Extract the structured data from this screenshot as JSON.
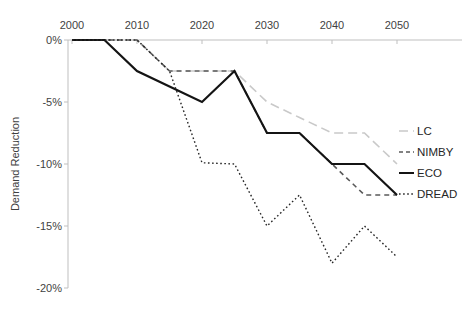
{
  "chart_data": {
    "type": "line",
    "title": "",
    "xlabel": "",
    "ylabel": "Demand Reduction",
    "xlim": [
      2000,
      2050
    ],
    "ylim": [
      -20,
      0
    ],
    "grid": false,
    "legend_position": "right",
    "axis_color": "#bfbfbf",
    "label_color": "#3f3f3f",
    "xticks": [
      2000,
      2010,
      2020,
      2030,
      2040,
      2050
    ],
    "yticks": [
      {
        "value": 0,
        "label": "0%"
      },
      {
        "value": -5,
        "label": "-5%"
      },
      {
        "value": -10,
        "label": "-10%"
      },
      {
        "value": -15,
        "label": "-15%"
      },
      {
        "value": -20,
        "label": "-20%"
      }
    ],
    "x": [
      2000,
      2005,
      2010,
      2015,
      2020,
      2025,
      2030,
      2035,
      2040,
      2045,
      2050
    ],
    "series": [
      {
        "name": "LC",
        "style": "long-dash",
        "color": "#c9c9c9",
        "width": 1.6,
        "values": [
          0,
          0,
          0,
          -2.5,
          -2.5,
          -2.5,
          -5,
          -6.25,
          -7.5,
          -7.5,
          -10
        ]
      },
      {
        "name": "NIMBY",
        "style": "dashed",
        "color": "#595959",
        "width": 1.6,
        "values": [
          0,
          0,
          0,
          -2.5,
          -2.5,
          -2.5,
          -7.5,
          -7.5,
          -10,
          -12.5,
          -12.5
        ]
      },
      {
        "name": "ECO",
        "style": "solid",
        "color": "#141414",
        "width": 2.2,
        "values": [
          0,
          0,
          -2.5,
          -3.75,
          -5,
          -2.5,
          -7.5,
          -7.5,
          -10,
          -10,
          -12.5
        ]
      },
      {
        "name": "DREAD",
        "style": "dotted",
        "color": "#262626",
        "width": 1.4,
        "values": [
          0,
          0,
          0,
          -2.5,
          -9.9,
          -10,
          -15,
          -12.5,
          -18,
          -15,
          -17.5
        ]
      }
    ]
  }
}
